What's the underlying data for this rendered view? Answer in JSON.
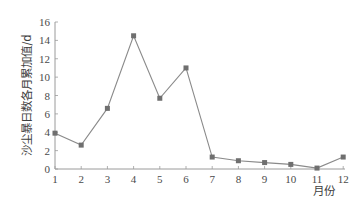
{
  "chart_data": {
    "type": "line",
    "title": "",
    "xlabel": "月份",
    "ylabel": "沙尘暴日数各月累加值/d",
    "categories": [
      "1",
      "2",
      "3",
      "4",
      "5",
      "6",
      "7",
      "8",
      "9",
      "10",
      "11",
      "12"
    ],
    "series": [
      {
        "name": "沙尘暴日数各月累加值",
        "values": [
          3.9,
          2.6,
          6.6,
          14.5,
          7.7,
          11.0,
          1.3,
          0.9,
          0.7,
          0.5,
          0.1,
          1.3
        ],
        "marker": "square"
      }
    ],
    "ylim": [
      0,
      16
    ],
    "yticks": [
      0,
      2,
      4,
      6,
      8,
      10,
      12,
      14,
      16
    ],
    "grid": false,
    "legend": null,
    "colors": {
      "line": "#8a8a8a",
      "marker": "#6f6f6f",
      "axis": "#9a9a9a",
      "text": "#4a4a4a"
    }
  }
}
